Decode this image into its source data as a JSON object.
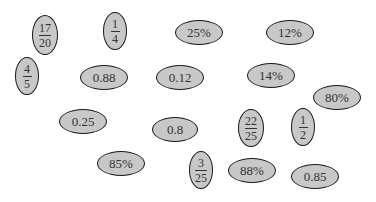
{
  "items": [
    {
      "kind": "fraction",
      "num": "17",
      "den": "20",
      "x": 45,
      "y": 35,
      "w": 26,
      "h": 40
    },
    {
      "kind": "fraction",
      "num": "1",
      "den": "4",
      "x": 115,
      "y": 31,
      "w": 24,
      "h": 38
    },
    {
      "kind": "text",
      "label": "25%",
      "x": 199,
      "y": 32,
      "w": 48,
      "h": 25
    },
    {
      "kind": "text",
      "label": "12%",
      "x": 290,
      "y": 32,
      "w": 48,
      "h": 25
    },
    {
      "kind": "fraction",
      "num": "4",
      "den": "5",
      "x": 27,
      "y": 76,
      "w": 24,
      "h": 38
    },
    {
      "kind": "text",
      "label": "0.88",
      "x": 104,
      "y": 77,
      "w": 48,
      "h": 25
    },
    {
      "kind": "text",
      "label": "0.12",
      "x": 180,
      "y": 77,
      "w": 48,
      "h": 25
    },
    {
      "kind": "text",
      "label": "14%",
      "x": 271,
      "y": 75,
      "w": 48,
      "h": 25
    },
    {
      "kind": "text",
      "label": "80%",
      "x": 337,
      "y": 97,
      "w": 48,
      "h": 25
    },
    {
      "kind": "text",
      "label": "0.25",
      "x": 83,
      "y": 121,
      "w": 48,
      "h": 25
    },
    {
      "kind": "text",
      "label": "0.8",
      "x": 175,
      "y": 129,
      "w": 46,
      "h": 25
    },
    {
      "kind": "fraction",
      "num": "22",
      "den": "25",
      "x": 251,
      "y": 128,
      "w": 26,
      "h": 38
    },
    {
      "kind": "fraction",
      "num": "1",
      "den": "2",
      "x": 303,
      "y": 127,
      "w": 24,
      "h": 38
    },
    {
      "kind": "text",
      "label": "85%",
      "x": 121,
      "y": 163,
      "w": 48,
      "h": 25
    },
    {
      "kind": "fraction",
      "num": "3",
      "den": "25",
      "x": 201,
      "y": 170,
      "w": 24,
      "h": 38
    },
    {
      "kind": "text",
      "label": "88%",
      "x": 252,
      "y": 170,
      "w": 48,
      "h": 25
    },
    {
      "kind": "text",
      "label": "0.85",
      "x": 315,
      "y": 176,
      "w": 48,
      "h": 25
    }
  ],
  "colors": {
    "fill": "#c8c8c8",
    "stroke": "#1a1a1a",
    "text": "#333333"
  }
}
